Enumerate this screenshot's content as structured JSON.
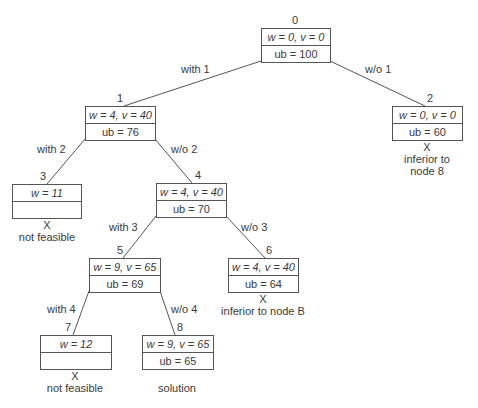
{
  "diagram": {
    "type": "branch-and-bound state-space tree",
    "nodes": [
      {
        "id": "0",
        "line1": "w = 0, v = 0",
        "line2": "ub = 100",
        "note_mark": "",
        "note": ""
      },
      {
        "id": "1",
        "line1": "w = 4, v = 40",
        "line2": "ub = 76",
        "note_mark": "",
        "note": ""
      },
      {
        "id": "2",
        "line1": "w = 0, v = 0",
        "line2": "ub = 60",
        "note_mark": "X",
        "note": "inferior to\nnode 8"
      },
      {
        "id": "3",
        "line1": "w = 11",
        "line2": "",
        "note_mark": "X",
        "note": "not feasible"
      },
      {
        "id": "4",
        "line1": "w = 4, v = 40",
        "line2": "ub = 70",
        "note_mark": "",
        "note": ""
      },
      {
        "id": "5",
        "line1": "w = 9, v = 65",
        "line2": "ub = 69",
        "note_mark": "",
        "note": ""
      },
      {
        "id": "6",
        "line1": "w = 4, v = 40",
        "line2": "ub = 64",
        "note_mark": "X",
        "note": "inferior to node B"
      },
      {
        "id": "7",
        "line1": "w = 12",
        "line2": "",
        "note_mark": "X",
        "note": "not feasible"
      },
      {
        "id": "8",
        "line1": "w = 9, v = 65",
        "line2": "ub = 65",
        "note_mark": "",
        "note": "solution"
      }
    ],
    "edges": [
      {
        "from": "0",
        "to": "1",
        "label": "with 1"
      },
      {
        "from": "0",
        "to": "2",
        "label": "w/o 1"
      },
      {
        "from": "1",
        "to": "3",
        "label": "with 2"
      },
      {
        "from": "1",
        "to": "4",
        "label": "w/o 2"
      },
      {
        "from": "4",
        "to": "5",
        "label": "with 3"
      },
      {
        "from": "4",
        "to": "6",
        "label": "w/o 3"
      },
      {
        "from": "5",
        "to": "7",
        "label": "with 4"
      },
      {
        "from": "5",
        "to": "8",
        "label": "w/o 4"
      }
    ]
  }
}
